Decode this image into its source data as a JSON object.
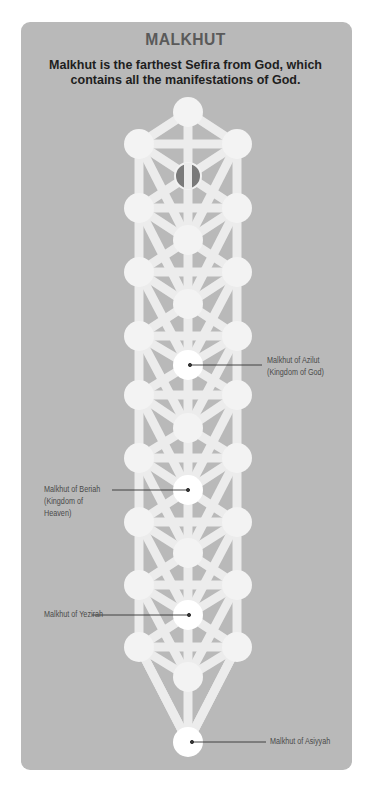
{
  "header": {
    "title": "MALKHUT",
    "subtitle": "Malkhut is the farthest Sefira from God, which contains all the manifestations of God."
  },
  "diagram": {
    "type": "chain of overlapping Trees of Life (sefirot)",
    "colors": {
      "card": "#b9b9b9",
      "node": "#f3f3f3",
      "path": "#ededed",
      "malkhut_node": "#ffffff",
      "daat_node": "#7a7a7a",
      "leader_line": "#333333",
      "label_text": "#4a4a4a"
    },
    "callouts": [
      {
        "id": "azilut",
        "line1": "Malkhut of Azilut",
        "line2": "(Kingdom of God)",
        "line3": "",
        "side": "right"
      },
      {
        "id": "beriah",
        "line1": "Malkhut of Beriah",
        "line2": "(Kingdom of",
        "line3": "Heaven)",
        "side": "left"
      },
      {
        "id": "yezirah",
        "line1": "Malkhut of Yezirah",
        "line2": "",
        "line3": "",
        "side": "left"
      },
      {
        "id": "asiyyah",
        "line1": "Malkhut of Asiyyah",
        "line2": "",
        "line3": "",
        "side": "right"
      }
    ]
  }
}
